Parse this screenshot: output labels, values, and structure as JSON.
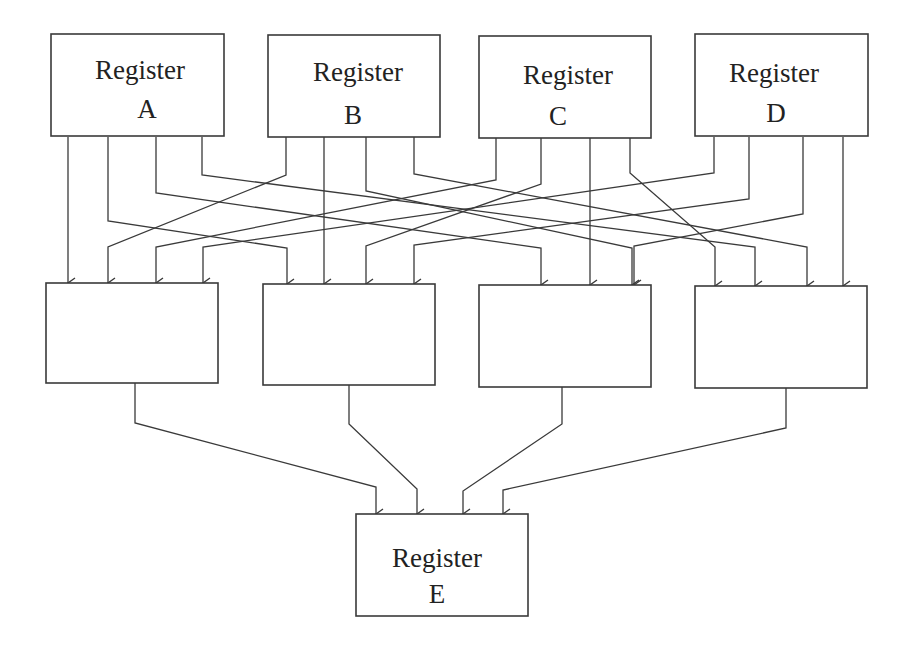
{
  "diagram": {
    "type": "register-interconnect",
    "source_registers": [
      {
        "id": "A",
        "title": "Register",
        "letter": "A"
      },
      {
        "id": "B",
        "title": "Register",
        "letter": "B"
      },
      {
        "id": "C",
        "title": "Register",
        "letter": "C"
      },
      {
        "id": "D",
        "title": "Register",
        "letter": "D"
      }
    ],
    "middle_units": [
      {
        "id": "M1",
        "inputs": [
          "A",
          "B",
          "C",
          "D"
        ]
      },
      {
        "id": "M2",
        "inputs": [
          "A",
          "B",
          "C",
          "D"
        ]
      },
      {
        "id": "M3",
        "inputs": [
          "A",
          "B",
          "C",
          "D"
        ]
      },
      {
        "id": "M4",
        "inputs": [
          "A",
          "B",
          "C",
          "D"
        ]
      }
    ],
    "destination_register": {
      "id": "E",
      "title": "Register",
      "letter": "E",
      "inputs": [
        "M1",
        "M2",
        "M3",
        "M4"
      ]
    },
    "line_color": "#3a3a3a"
  }
}
